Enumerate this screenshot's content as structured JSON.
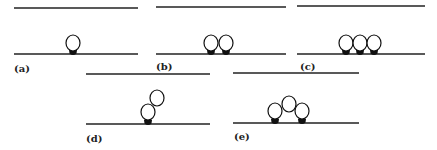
{
  "figure": {
    "panels": [
      {
        "id": "a",
        "label": "(a)",
        "description": "single bead attached to lower line",
        "top_line": {
          "x1": 14,
          "x2": 138,
          "y": 8
        },
        "bottom_line": {
          "x1": 14,
          "x2": 138,
          "y": 54
        },
        "label_pos": {
          "x": 14,
          "y": 72
        },
        "beads": [
          {
            "cx": 73,
            "cy": 43,
            "r": 7,
            "anchored": true
          }
        ]
      },
      {
        "id": "b",
        "label": "(b)",
        "description": "two adjacent beads, both anchored",
        "top_line": {
          "x1": 156,
          "x2": 286,
          "y": 7
        },
        "bottom_line": {
          "x1": 156,
          "x2": 286,
          "y": 54
        },
        "label_pos": {
          "x": 156,
          "y": 70
        },
        "beads": [
          {
            "cx": 211,
            "cy": 43,
            "r": 7,
            "anchored": true
          },
          {
            "cx": 226,
            "cy": 43,
            "r": 7,
            "anchored": true
          }
        ]
      },
      {
        "id": "c",
        "label": "(c)",
        "description": "three adjacent beads, all anchored",
        "top_line": {
          "x1": 297,
          "x2": 425,
          "y": 6
        },
        "bottom_line": {
          "x1": 297,
          "x2": 425,
          "y": 54
        },
        "label_pos": {
          "x": 300,
          "y": 70
        },
        "beads": [
          {
            "cx": 346,
            "cy": 43,
            "r": 7,
            "anchored": true
          },
          {
            "cx": 360,
            "cy": 43,
            "r": 7,
            "anchored": true
          },
          {
            "cx": 374,
            "cy": 43,
            "r": 7,
            "anchored": true
          }
        ]
      },
      {
        "id": "d",
        "label": "(d)",
        "description": "two stacked beads, lower one anchored",
        "top_line": {
          "x1": 86,
          "x2": 210,
          "y": 74
        },
        "bottom_line": {
          "x1": 86,
          "x2": 210,
          "y": 124
        },
        "label_pos": {
          "x": 86,
          "y": 142
        },
        "beads": [
          {
            "cx": 148,
            "cy": 112,
            "r": 7,
            "anchored": true
          },
          {
            "cx": 157,
            "cy": 98,
            "r": 7,
            "anchored": false
          }
        ]
      },
      {
        "id": "e",
        "label": "(e)",
        "description": "three beads in arch, outer two anchored",
        "top_line": {
          "x1": 233,
          "x2": 359,
          "y": 73
        },
        "bottom_line": {
          "x1": 233,
          "x2": 359,
          "y": 123
        },
        "label_pos": {
          "x": 234,
          "y": 140
        },
        "beads": [
          {
            "cx": 275,
            "cy": 111,
            "r": 7,
            "anchored": true
          },
          {
            "cx": 289,
            "cy": 104,
            "r": 7,
            "anchored": false
          },
          {
            "cx": 302,
            "cy": 111,
            "r": 7,
            "anchored": true
          }
        ]
      }
    ]
  }
}
